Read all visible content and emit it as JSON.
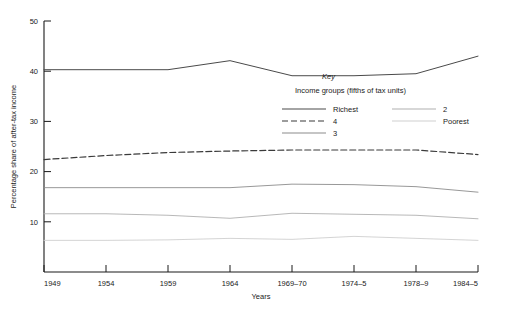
{
  "chart_data": {
    "type": "line",
    "title": "",
    "xlabel": "Years",
    "ylabel": "Percentage share of after-tax income",
    "categories": [
      "1949",
      "1954",
      "1959",
      "1964",
      "1969–70",
      "1974–5",
      "1978–9",
      "1984–5"
    ],
    "x": [
      0,
      1,
      2,
      3,
      4,
      5,
      6,
      7
    ],
    "ylim": [
      0,
      50
    ],
    "yticks": [
      10,
      20,
      30,
      40,
      50
    ],
    "ytick_labels": [
      "10",
      "20",
      "30",
      "40",
      "50"
    ],
    "grid": false,
    "legend_position": "inside-upper-right",
    "legend_title": "Key",
    "legend_subtitle": "Income groups (fifths of tax units)",
    "series": [
      {
        "name": "Richest",
        "style": "solid",
        "color": "#4a4a4a",
        "width": 1.0,
        "values": [
          40.3,
          40.3,
          40.3,
          42.1,
          39.1,
          39.1,
          39.5,
          43.0
        ]
      },
      {
        "name": "4",
        "style": "dashed",
        "color": "#3a3a3a",
        "width": 1.2,
        "values": [
          22.4,
          23.2,
          23.8,
          24.1,
          24.3,
          24.3,
          24.3,
          23.4
        ]
      },
      {
        "name": "3",
        "style": "solid",
        "color": "#8c8c8c",
        "width": 0.9,
        "values": [
          16.8,
          16.8,
          16.8,
          16.8,
          17.5,
          17.4,
          17.0,
          15.9
        ]
      },
      {
        "name": "2",
        "style": "solid",
        "color": "#b0b0b0",
        "width": 0.9,
        "values": [
          11.6,
          11.6,
          11.3,
          10.7,
          11.7,
          11.5,
          11.3,
          10.6
        ]
      },
      {
        "name": "Poorest",
        "style": "solid",
        "color": "#cfcfcf",
        "width": 0.9,
        "values": [
          6.3,
          6.3,
          6.4,
          6.7,
          6.5,
          7.1,
          6.7,
          6.3
        ]
      }
    ],
    "legend_entries": [
      {
        "label": "Richest",
        "column": "left",
        "style": "solid",
        "color": "#4a4a4a"
      },
      {
        "label": "4",
        "column": "left",
        "style": "dashed",
        "color": "#3a3a3a"
      },
      {
        "label": "3",
        "column": "left",
        "style": "solid",
        "color": "#8c8c8c"
      },
      {
        "label": "2",
        "column": "right",
        "style": "solid",
        "color": "#b0b0b0"
      },
      {
        "label": "Poorest",
        "column": "right",
        "style": "solid",
        "color": "#cfcfcf"
      }
    ]
  }
}
